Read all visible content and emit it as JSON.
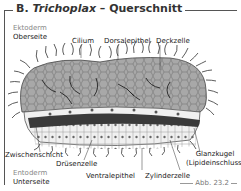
{
  "figure": {
    "title_prefix": "B.",
    "title_italic": "Trichoplax",
    "title_suffix": "– Querschnitt",
    "figure_number": "Abb. 23.2"
  },
  "labels": {
    "ektoderm": "Ektoderm",
    "oberseite": "Oberseite",
    "cilium": "Cilium",
    "dorsalepithel": "Dorsalepithel",
    "deckzelle": "Deckzelle",
    "zwischenschicht": "Zwischenschicht",
    "druesenzelle": "Drüsenzelle",
    "glanzkugel": "Glanzkugel",
    "lipideinschluss": "(Lipideinschluss)",
    "entoderm": "Entoderm",
    "unterseite": "Unterseite",
    "ventralepithel": "Ventralepithel",
    "zylinderzelle": "Zylinderzelle"
  },
  "colors": {
    "dorsal_fill": "#a8a8a8",
    "ventral_fill": "#f0f0f0",
    "middle_band": "#3a3a3a",
    "label_gray": "#888888"
  }
}
